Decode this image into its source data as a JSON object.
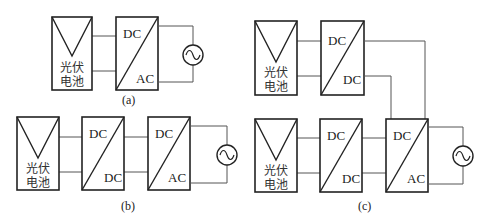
{
  "diagrams": {
    "a": {
      "caption": "(a)",
      "pv": {
        "line1": "光伏",
        "line2": "电池"
      },
      "inverter": {
        "top": "DC",
        "bottom": "AC"
      }
    },
    "b": {
      "caption": "(b)",
      "pv": {
        "line1": "光伏",
        "line2": "电池"
      },
      "dcdc": {
        "top": "DC",
        "bottom": "DC"
      },
      "inverter": {
        "top": "DC",
        "bottom": "AC"
      }
    },
    "c": {
      "caption": "(c)",
      "pv_top": {
        "line1": "光伏",
        "line2": "电池"
      },
      "dcdc_top": {
        "top": "DC",
        "bottom": "DC"
      },
      "pv_bottom": {
        "line1": "光伏",
        "line2": "电池"
      },
      "dcdc_bottom": {
        "top": "DC",
        "bottom": "DC"
      },
      "inverter": {
        "top": "DC",
        "bottom": "AC"
      }
    }
  },
  "icons": {
    "ac_source": "sine-wave-in-circle"
  }
}
